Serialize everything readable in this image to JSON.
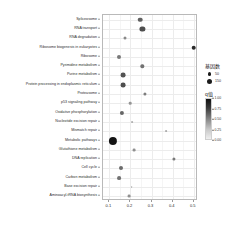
{
  "chart_data": {
    "type": "scatter",
    "title": "",
    "xlabel": "",
    "ylabel": "",
    "xlim": [
      0.07,
      0.52
    ],
    "ylim": [
      0,
      19
    ],
    "grid": true,
    "legend_position": "right",
    "x_ticks": [
      "0.1",
      "0.2",
      "0.3",
      "0.4",
      "0.5"
    ],
    "x_tick_values": [
      0.1,
      0.2,
      0.3,
      0.4,
      0.5
    ],
    "categories": [
      "Spliceosome",
      "RNA transport",
      "RNA degradation",
      "Ribosome biogenesis in eukaryotes",
      "Ribosome",
      "Pyrimidine metabolism",
      "Purine metabolism",
      "Protein processing in endoplasmic reticulum",
      "Proteasome",
      "p53 signaling pathway",
      "Oxidative phosphorylation",
      "Nucleotide excision repair",
      "Mismatch repair",
      "Metabolic pathways",
      "Glutathione metabolism",
      "DNA replication",
      "Cell cycle",
      "Carbon metabolism",
      "Base excision repair",
      "Aminoacyl-tRNA biosynthesis"
    ],
    "points": [
      {
        "label": "Spliceosome",
        "x": 0.247,
        "size": 4.6,
        "color": 0.62
      },
      {
        "label": "RNA transport",
        "x": 0.257,
        "size": 5.2,
        "color": 0.7
      },
      {
        "label": "RNA degradation",
        "x": 0.175,
        "size": 3.0,
        "color": 0.45
      },
      {
        "label": "Ribosome biogenesis in eukaryotes",
        "x": 0.5,
        "size": 4.6,
        "color": 0.86
      },
      {
        "label": "Ribosome",
        "x": 0.146,
        "size": 4.0,
        "color": 0.52
      },
      {
        "label": "Pyrimidine metabolism",
        "x": 0.256,
        "size": 3.4,
        "color": 0.55
      },
      {
        "label": "Purine metabolism",
        "x": 0.167,
        "size": 4.8,
        "color": 0.68
      },
      {
        "label": "Protein processing in endoplasmic reticulum",
        "x": 0.167,
        "size": 4.8,
        "color": 0.7
      },
      {
        "label": "Proteasome",
        "x": 0.27,
        "size": 3.2,
        "color": 0.5
      },
      {
        "label": "p53 signaling pathway",
        "x": 0.2,
        "size": 2.6,
        "color": 0.4
      },
      {
        "label": "Oxidative phosphorylation",
        "x": 0.159,
        "size": 4.2,
        "color": 0.6
      },
      {
        "label": "Nucleotide excision repair",
        "x": 0.208,
        "size": 1.8,
        "color": 0.28
      },
      {
        "label": "Mismatch repair",
        "x": 0.368,
        "size": 1.8,
        "color": 0.3
      },
      {
        "label": "Metabolic pathways",
        "x": 0.118,
        "size": 8.2,
        "color": 0.95
      },
      {
        "label": "Glutathione metabolism",
        "x": 0.216,
        "size": 2.8,
        "color": 0.42
      },
      {
        "label": "DNA replication",
        "x": 0.405,
        "size": 3.2,
        "color": 0.52
      },
      {
        "label": "Cell cycle",
        "x": 0.156,
        "size": 4.0,
        "color": 0.58
      },
      {
        "label": "Carbon metabolism",
        "x": 0.146,
        "size": 3.8,
        "color": 0.55
      },
      {
        "label": "Base excision repair",
        "x": 0.205,
        "size": 1.8,
        "color": 0.26
      },
      {
        "label": "Aminoacyl-tRNA biosynthesis",
        "x": 0.192,
        "size": 2.8,
        "color": 0.42
      }
    ],
    "size_legend": {
      "title": "基因数",
      "entries": [
        {
          "label": "50",
          "diameter": 3.2
        },
        {
          "label": "150",
          "diameter": 5.0
        }
      ]
    },
    "color_legend": {
      "title": "q值",
      "ticks": [
        "1.00",
        "0.75",
        "0.50",
        "0.25",
        "0.00"
      ],
      "tick_values": [
        1.0,
        0.75,
        0.5,
        0.25,
        0.0
      ],
      "high_color": "#101010",
      "low_color": "#efefef"
    }
  }
}
